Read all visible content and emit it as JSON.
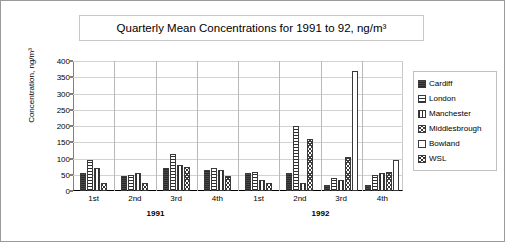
{
  "chart_data": {
    "type": "bar",
    "title": "Quarterly Mean Concentrations for 1991 to 92, ng/m³",
    "xlabel": "",
    "ylabel": "Concentration, ng/m³",
    "ylim": [
      0,
      400
    ],
    "yticks": [
      0,
      50,
      100,
      150,
      200,
      250,
      300,
      350,
      400
    ],
    "grid": true,
    "legend_position": "right",
    "categories": [
      "1st",
      "2nd",
      "3rd",
      "4th",
      "1st",
      "2nd",
      "3rd",
      "4th"
    ],
    "group_labels": [
      "1991",
      "1992"
    ],
    "series": [
      {
        "name": "Cardiff",
        "pattern": "solid",
        "values": [
          55,
          45,
          70,
          65,
          55,
          55,
          20,
          20
        ]
      },
      {
        "name": "London",
        "pattern": "horiz",
        "values": [
          95,
          50,
          115,
          70,
          60,
          200,
          40,
          50
        ]
      },
      {
        "name": "Manchester",
        "pattern": "vert",
        "values": [
          70,
          55,
          80,
          65,
          35,
          25,
          35,
          55
        ]
      },
      {
        "name": "Middlesbrough",
        "pattern": "cross",
        "values": [
          null,
          null,
          null,
          null,
          null,
          160,
          105,
          60
        ]
      },
      {
        "name": "Bowland",
        "pattern": "empty",
        "values": [
          null,
          null,
          null,
          null,
          null,
          null,
          370,
          95
        ]
      },
      {
        "name": "WSL",
        "pattern": "cross2",
        "values": [
          25,
          25,
          75,
          45,
          25,
          null,
          null,
          null
        ]
      }
    ]
  },
  "legend": {
    "items": [
      {
        "label": "Cardiff"
      },
      {
        "label": "London"
      },
      {
        "label": "Manchester"
      },
      {
        "label": "Middlesbrough"
      },
      {
        "label": "Bowland"
      },
      {
        "label": "WSL"
      }
    ]
  },
  "axis": {
    "y_title": "Concentration, ng/m³",
    "y_ticks": [
      "400",
      "350",
      "300",
      "250",
      "200",
      "150",
      "100",
      "50",
      "0"
    ],
    "x_ticks": [
      "1st",
      "2nd",
      "3rd",
      "4th",
      "1st",
      "2nd",
      "3rd",
      "4th"
    ],
    "x_years": [
      "1991",
      "1992"
    ]
  },
  "colors": {
    "frame": "#9a9a9a",
    "grid": "#d2d2d2",
    "axis": "#000000",
    "bar_outline": "#3a3a3a",
    "background": "#ffffff"
  }
}
